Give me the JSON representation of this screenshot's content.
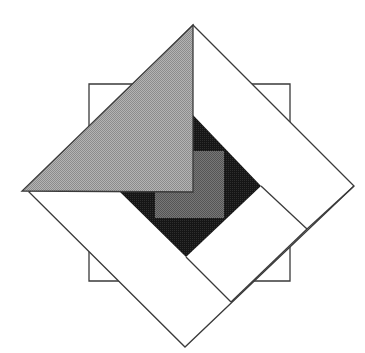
{
  "diagram": {
    "type": "geometric-composition",
    "canvas": {
      "width": 365,
      "height": 353,
      "background": "#ffffff"
    },
    "stroke": {
      "color": "#3a3a3a",
      "width": 1.3
    },
    "shapes": [
      {
        "name": "back-square",
        "kind": "rect",
        "fill": "#ffffff",
        "points": [
          [
            89,
            84
          ],
          [
            290,
            84
          ],
          [
            290,
            281
          ],
          [
            89,
            281
          ]
        ]
      },
      {
        "name": "frame-diamond-outer",
        "kind": "polygon",
        "fill": "#ffffff",
        "points": [
          [
            193,
            25
          ],
          [
            354,
            186
          ],
          [
            185,
            347
          ],
          [
            29,
            192
          ]
        ]
      },
      {
        "name": "dark-diamond",
        "kind": "polygon",
        "fill": "#1c1c1c",
        "points": [
          [
            193,
            115
          ],
          [
            261,
            186
          ],
          [
            186,
            257
          ],
          [
            120,
            192
          ]
        ]
      },
      {
        "name": "mid-gray-square",
        "kind": "rect",
        "fill": "#6e6e6e",
        "points": [
          [
            155,
            151
          ],
          [
            224,
            151
          ],
          [
            224,
            218
          ],
          [
            155,
            218
          ]
        ]
      },
      {
        "name": "band-inner-edge-right",
        "kind": "line",
        "points": [
          [
            261,
            186
          ],
          [
            307,
            229
          ]
        ]
      },
      {
        "name": "band-seam-right",
        "kind": "line",
        "points": [
          [
            307,
            229
          ],
          [
            354,
            186
          ]
        ]
      },
      {
        "name": "band-inner-edge-bottom",
        "kind": "line",
        "points": [
          [
            186,
            257
          ],
          [
            231,
            302
          ]
        ]
      },
      {
        "name": "band-seam-bottom",
        "kind": "line",
        "points": [
          [
            231,
            302
          ],
          [
            307,
            229
          ]
        ]
      },
      {
        "name": "light-gray-triangle",
        "kind": "polygon",
        "fill": "#aaaaaa",
        "points": [
          [
            193,
            25
          ],
          [
            193,
            192
          ],
          [
            22,
            191
          ]
        ]
      }
    ]
  }
}
